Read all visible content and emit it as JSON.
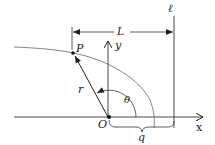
{
  "diagram": {
    "labels": {
      "P": "P",
      "y": "y",
      "L": "L",
      "ell": "ℓ",
      "r": "r",
      "theta": "θ",
      "O": "O",
      "x": "x",
      "q": "q"
    },
    "colors": {
      "ink": "#222222",
      "curve": "#777777"
    }
  }
}
